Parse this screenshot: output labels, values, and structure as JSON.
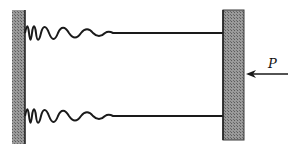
{
  "diagram": {
    "type": "mechanical-schematic",
    "elements": {
      "left_wall": {
        "description": "fixed hatched wall"
      },
      "springs": [
        {
          "position": "top",
          "connects": "left_wall to rigid_block"
        },
        {
          "position": "bottom",
          "connects": "left_wall to rigid_block"
        }
      ],
      "rigid_block": {
        "description": "hatched rigid plate on the right"
      },
      "force": {
        "label": "P",
        "direction": "left"
      }
    },
    "colors": {
      "hatch": "#8a8a8a",
      "line": "#1a1a1a",
      "background": "#ffffff"
    }
  },
  "labels": {
    "force": "P"
  }
}
